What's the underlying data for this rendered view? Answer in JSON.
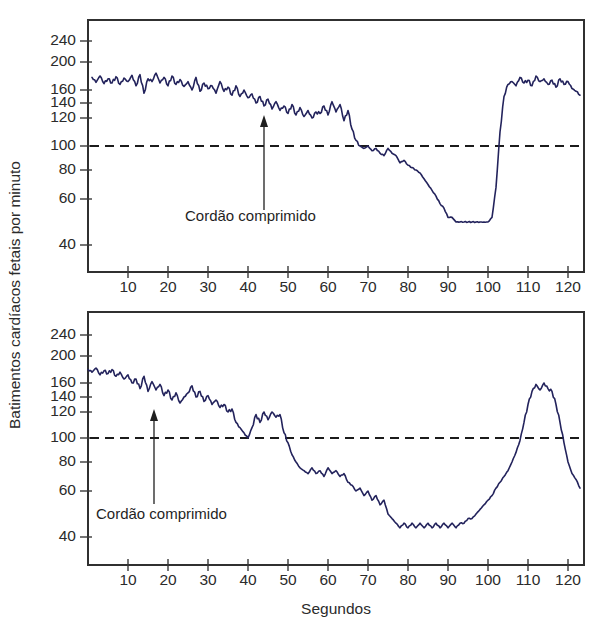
{
  "figure": {
    "title": "",
    "axis_titles": {
      "y": "Batimentos cardíacos fetais por minuto",
      "x": "Segundos"
    }
  },
  "chart_data": [
    {
      "type": "line",
      "panel": "top",
      "title": "",
      "xlabel": "Segundos",
      "ylabel": "Batimentos cardíacos fetais por minuto",
      "xlim": [
        0,
        124
      ],
      "ylim": [
        30,
        260
      ],
      "y_scale": "nonlinear-compressed-at-top",
      "grid": false,
      "legend": "none",
      "xticks": [
        10,
        20,
        30,
        40,
        50,
        60,
        70,
        80,
        90,
        100,
        110,
        120
      ],
      "yticks": [
        40,
        60,
        80,
        100,
        120,
        140,
        160,
        200,
        240
      ],
      "annotations": [
        {
          "text": "Cordão comprimido",
          "x": 43,
          "y": 120,
          "type": "arrow-up"
        }
      ],
      "reference_lines": [
        {
          "value": 100,
          "style": "dashed",
          "orientation": "horizontal"
        }
      ],
      "series": [
        {
          "name": "Frequência cardíaca fetal",
          "color": "#23235c",
          "x": [
            1,
            2,
            3,
            4,
            5,
            6,
            7,
            8,
            9,
            10,
            11,
            12,
            13,
            14,
            15,
            16,
            17,
            18,
            19,
            20,
            21,
            22,
            23,
            24,
            25,
            26,
            27,
            28,
            29,
            30,
            31,
            32,
            33,
            34,
            35,
            36,
            37,
            38,
            39,
            40,
            41,
            42,
            43,
            44,
            45,
            46,
            47,
            48,
            49,
            50,
            51,
            52,
            53,
            54,
            55,
            56,
            57,
            58,
            59,
            60,
            61,
            62,
            63,
            64,
            65,
            66,
            67,
            68,
            69,
            70,
            71,
            72,
            73,
            74,
            75,
            76,
            77,
            78,
            79,
            80,
            81,
            82,
            83,
            84,
            85,
            86,
            87,
            88,
            89,
            90,
            91,
            92,
            93,
            94,
            95,
            96,
            97,
            98,
            99,
            100,
            101,
            102,
            103,
            104,
            105,
            106,
            107,
            108,
            109,
            110,
            111,
            112,
            113,
            114,
            115,
            116,
            117,
            118,
            119,
            120,
            121,
            122,
            123
          ],
          "values": [
            178,
            171,
            180,
            169,
            176,
            170,
            179,
            168,
            177,
            172,
            181,
            166,
            182,
            155,
            176,
            172,
            184,
            170,
            178,
            166,
            180,
            168,
            175,
            165,
            172,
            160,
            178,
            158,
            170,
            162,
            166,
            155,
            172,
            158,
            164,
            152,
            166,
            150,
            160,
            148,
            154,
            140,
            150,
            136,
            146,
            132,
            142,
            130,
            136,
            126,
            138,
            124,
            134,
            122,
            130,
            120,
            128,
            126,
            136,
            124,
            142,
            128,
            138,
            118,
            130,
            112,
            104,
            100,
            98,
            100,
            96,
            98,
            94,
            92,
            98,
            94,
            92,
            86,
            88,
            84,
            82,
            80,
            78,
            74,
            70,
            66,
            62,
            58,
            56,
            52,
            52,
            50,
            50,
            50,
            50,
            50,
            50,
            50,
            50,
            50,
            52,
            68,
            110,
            150,
            168,
            172,
            166,
            178,
            170,
            174,
            166,
            180,
            172,
            176,
            168,
            174,
            164,
            176,
            168,
            172,
            162,
            158,
            152
          ]
        }
      ]
    },
    {
      "type": "line",
      "panel": "bottom",
      "title": "",
      "xlabel": "Segundos",
      "ylabel": "Batimentos cardíacos fetais por minuto",
      "xlim": [
        0,
        124
      ],
      "ylim": [
        30,
        260
      ],
      "y_scale": "nonlinear-compressed-at-top",
      "grid": false,
      "legend": "none",
      "xticks": [
        10,
        20,
        30,
        40,
        50,
        60,
        70,
        80,
        90,
        100,
        110,
        120
      ],
      "yticks": [
        40,
        60,
        80,
        100,
        120,
        140,
        160,
        200,
        240
      ],
      "annotations": [
        {
          "text": "Cordão comprimido",
          "x": 14,
          "y": 120,
          "type": "arrow-up"
        }
      ],
      "reference_lines": [
        {
          "value": 100,
          "style": "dashed",
          "orientation": "horizontal"
        }
      ],
      "series": [
        {
          "name": "Frequência cardíaca fetal",
          "color": "#23235c",
          "x": [
            0,
            1,
            2,
            3,
            4,
            5,
            6,
            7,
            8,
            9,
            10,
            11,
            12,
            13,
            14,
            15,
            16,
            17,
            18,
            19,
            20,
            21,
            22,
            23,
            24,
            25,
            26,
            27,
            28,
            29,
            30,
            31,
            32,
            33,
            34,
            35,
            36,
            37,
            38,
            39,
            40,
            41,
            42,
            43,
            44,
            45,
            46,
            47,
            48,
            49,
            50,
            51,
            52,
            53,
            54,
            55,
            56,
            57,
            58,
            59,
            60,
            61,
            62,
            63,
            64,
            65,
            66,
            67,
            68,
            69,
            70,
            71,
            72,
            73,
            74,
            75,
            76,
            77,
            78,
            79,
            80,
            81,
            82,
            83,
            84,
            85,
            86,
            87,
            88,
            89,
            90,
            91,
            92,
            93,
            94,
            95,
            96,
            97,
            98,
            99,
            100,
            101,
            102,
            103,
            104,
            105,
            106,
            107,
            108,
            109,
            110,
            111,
            112,
            113,
            114,
            115,
            116,
            117,
            118,
            119,
            120,
            121,
            122,
            123
          ],
          "values": [
            180,
            176,
            182,
            172,
            178,
            174,
            180,
            170,
            176,
            166,
            172,
            160,
            166,
            152,
            170,
            148,
            162,
            150,
            158,
            142,
            150,
            136,
            146,
            132,
            140,
            146,
            156,
            140,
            148,
            134,
            142,
            130,
            136,
            126,
            130,
            120,
            124,
            112,
            108,
            104,
            100,
            108,
            118,
            112,
            120,
            114,
            120,
            116,
            118,
            104,
            96,
            86,
            80,
            76,
            74,
            72,
            76,
            72,
            74,
            70,
            76,
            72,
            74,
            70,
            72,
            66,
            64,
            60,
            62,
            58,
            60,
            56,
            58,
            54,
            56,
            50,
            48,
            46,
            44,
            46,
            44,
            46,
            44,
            46,
            44,
            46,
            44,
            46,
            44,
            46,
            44,
            46,
            44,
            46,
            46,
            48,
            48,
            50,
            52,
            54,
            56,
            58,
            62,
            66,
            70,
            74,
            80,
            88,
            98,
            112,
            130,
            148,
            158,
            150,
            160,
            152,
            148,
            130,
            112,
            96,
            80,
            72,
            68,
            62,
            60,
            58,
            56,
            60,
            58,
            60,
            58,
            60
          ]
        }
      ]
    }
  ]
}
